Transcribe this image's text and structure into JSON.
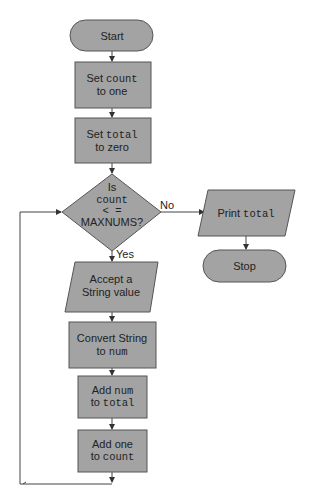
{
  "diagram": {
    "type": "flowchart",
    "nodes": {
      "start": {
        "shape": "terminator",
        "text": "Start"
      },
      "set_count": {
        "shape": "process",
        "line1_a": "Set ",
        "line1_b": "count",
        "line2": "to one"
      },
      "set_total": {
        "shape": "process",
        "line1_a": "Set ",
        "line1_b": "total",
        "line2": "to zero"
      },
      "decision": {
        "shape": "decision",
        "line1": "Is",
        "line2": "count",
        "line3": "< =",
        "line4": "MAXNUMS?"
      },
      "print_total": {
        "shape": "io",
        "text_a": "Print ",
        "text_b": "total"
      },
      "stop": {
        "shape": "terminator",
        "text": "Stop"
      },
      "accept": {
        "shape": "io",
        "line1": "Accept a",
        "line2": "String value"
      },
      "convert": {
        "shape": "process",
        "line1": "Convert String",
        "line2_a": "to ",
        "line2_b": "num"
      },
      "add_num": {
        "shape": "process",
        "line1_a": "Add ",
        "line1_b": "num",
        "line2_a": "to ",
        "line2_b": "total"
      },
      "add_one": {
        "shape": "process",
        "line1": "Add one",
        "line2_a": "to ",
        "line2_b": "count"
      }
    },
    "edges": {
      "no_label": "No",
      "yes_label": "Yes"
    },
    "colors": {
      "fill": "#a3a3a3",
      "stroke": "#555555",
      "text": "#222222"
    }
  }
}
